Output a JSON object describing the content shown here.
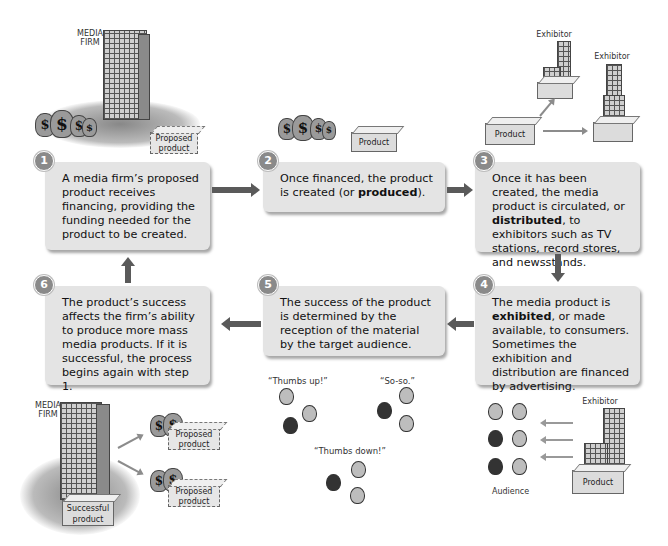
{
  "steps": [
    {
      "number": "1",
      "text": "A media firm’s proposed product receives financing, providing the funding needed for the product to be created."
    },
    {
      "number": "2",
      "text_before": "Once financed, the product is created (or ",
      "bold": "produced",
      "text_after": ")."
    },
    {
      "number": "3",
      "text_before": "Once it has been created, the media product is circulated, or ",
      "bold": "distributed",
      "text_after": ", to exhibitors such as TV stations, record stores, and newsstands."
    },
    {
      "number": "4",
      "text_before": "The media product is ",
      "bold": "exhibited",
      "text_after": ", or made available, to consumers. Sometimes the exhibition and distribution are financed by advertising."
    },
    {
      "number": "5",
      "text": "The success of the product is determined by the reception of the material by the target audience."
    },
    {
      "number": "6",
      "text": "The product’s success affects the firm’s ability to produce more mass media products. If it is successful, the process begins again with step 1."
    }
  ],
  "illustrations": {
    "top_left": {
      "firm_label_line1": "MEDIA",
      "firm_label_line2": "FIRM",
      "box_line1": "Proposed",
      "box_line2": "product",
      "bag_symbol": "$"
    },
    "top_center": {
      "box_label": "Product",
      "bag_symbol": "$"
    },
    "top_right": {
      "exhibitor1": "Exhibitor",
      "exhibitor2": "Exhibitor",
      "box_label": "Product"
    },
    "bottom_right": {
      "exhibitor": "Exhibitor",
      "box_label": "Product",
      "audience_label": "Audience"
    },
    "bottom_center": {
      "quote_up": "“Thumbs up!”",
      "quote_soso": "“So-so.”",
      "quote_down": "“Thumbs down!”"
    },
    "bottom_left": {
      "firm_label_line1": "MEDIA",
      "firm_label_line2": "FIRM",
      "success_line1": "Successful",
      "success_line2": "product",
      "proposed_line1": "Proposed",
      "proposed_line2": "product",
      "bag_symbol": "$"
    }
  },
  "colors": {
    "box_fill": "#e4e4e4",
    "badge": "#8a8a8a",
    "arrow": "#5a5a5a"
  }
}
